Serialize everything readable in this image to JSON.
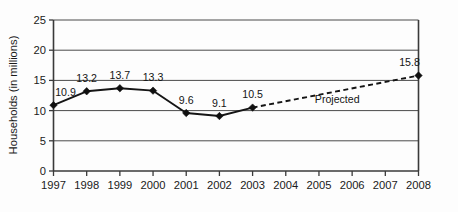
{
  "chart_data": {
    "type": "line",
    "title": "",
    "xlabel": "",
    "ylabel": "Households (in millions)",
    "ylim": [
      0,
      25
    ],
    "yticks": [
      "0",
      "5",
      "10",
      "15",
      "20",
      "25"
    ],
    "grid": true,
    "legend_position": "none",
    "categories": [
      "1997",
      "1998",
      "1999",
      "2000",
      "2001",
      "2002",
      "2003",
      "2004",
      "2005",
      "2006",
      "2007",
      "2008"
    ],
    "x": [
      1997,
      1998,
      1999,
      2000,
      2001,
      2002,
      2003,
      2004,
      2005,
      2006,
      2007,
      2008
    ],
    "series": [
      {
        "name": "Actual",
        "style": "solid",
        "x": [
          1997,
          1998,
          1999,
          2000,
          2001,
          2002,
          2003
        ],
        "values": [
          10.9,
          13.2,
          13.7,
          13.3,
          9.6,
          9.1,
          10.5
        ],
        "labels": [
          "10.9",
          "13.2",
          "13.7",
          "13.3",
          "9.6",
          "9.1",
          "10.5"
        ]
      },
      {
        "name": "Projected",
        "style": "dashed",
        "x": [
          2003,
          2008
        ],
        "values": [
          10.5,
          15.8
        ],
        "labels": [
          "",
          "15.8"
        ]
      }
    ],
    "annotations": [
      {
        "text": "Projected",
        "x": 2005.55,
        "y": 11.25
      }
    ]
  }
}
